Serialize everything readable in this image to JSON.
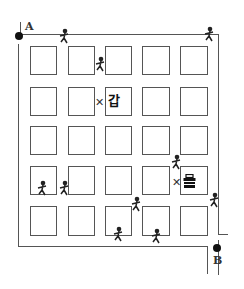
{
  "map": {
    "start_label": "A",
    "end_label": "B",
    "marker_gap": "갑",
    "marker_eul_icon": "box-icon",
    "x_mark": "✕",
    "grid": {
      "rows": 5,
      "cols": 5
    },
    "columns_x": [
      30,
      68,
      105,
      142,
      180
    ],
    "column_widths": [
      27,
      27,
      27,
      28,
      28
    ],
    "rows_y": [
      46,
      87,
      126,
      166,
      206
    ],
    "row_heights": [
      29,
      29,
      29,
      29,
      30
    ],
    "person_glyph": "🏃"
  }
}
